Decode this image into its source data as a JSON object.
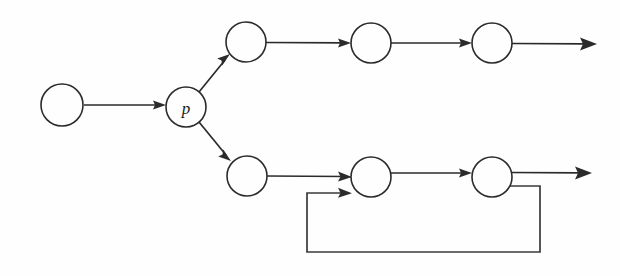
{
  "diagram": {
    "type": "directed-graph",
    "background_color": "#fefefe",
    "stroke_color": "#2b2b2b",
    "canvas": {
      "width": 620,
      "height": 276
    },
    "nodes": [
      {
        "id": "n0",
        "label": "",
        "cx": 62,
        "cy": 105,
        "r": 21,
        "name": "node-start"
      },
      {
        "id": "p",
        "label": "p",
        "cx": 186,
        "cy": 107,
        "r": 20,
        "name": "node-p"
      },
      {
        "id": "u1",
        "label": "",
        "cx": 246,
        "cy": 42,
        "r": 20,
        "name": "node-upper-1"
      },
      {
        "id": "u2",
        "label": "",
        "cx": 371,
        "cy": 43,
        "r": 20,
        "name": "node-upper-2"
      },
      {
        "id": "u3",
        "label": "",
        "cx": 492,
        "cy": 43,
        "r": 20,
        "name": "node-upper-3"
      },
      {
        "id": "l1",
        "label": "",
        "cx": 247,
        "cy": 176,
        "r": 20,
        "name": "node-lower-1"
      },
      {
        "id": "l2",
        "label": "",
        "cx": 371,
        "cy": 177,
        "r": 20,
        "name": "node-lower-2"
      },
      {
        "id": "l3",
        "label": "",
        "cx": 492,
        "cy": 177,
        "r": 20,
        "name": "node-lower-3"
      }
    ],
    "edges": [
      {
        "id": "e0",
        "from": "n0",
        "to": "p",
        "kind": "straight",
        "name": "edge-start-to-p"
      },
      {
        "id": "e1",
        "from": "p",
        "to": "u1",
        "kind": "diagonal-up",
        "name": "edge-p-to-upper-1"
      },
      {
        "id": "e2",
        "from": "p",
        "to": "l1",
        "kind": "diagonal-down",
        "name": "edge-p-to-lower-1"
      },
      {
        "id": "e3",
        "from": "u1",
        "to": "u2",
        "kind": "straight",
        "name": "edge-upper-1-to-2"
      },
      {
        "id": "e4",
        "from": "u2",
        "to": "u3",
        "kind": "straight",
        "name": "edge-upper-2-to-3"
      },
      {
        "id": "e5",
        "from": "u3",
        "to": "",
        "kind": "open-end",
        "name": "edge-upper-3-to-exit"
      },
      {
        "id": "e6",
        "from": "l1",
        "to": "l2",
        "kind": "straight",
        "name": "edge-lower-1-to-2"
      },
      {
        "id": "e7",
        "from": "l2",
        "to": "l3",
        "kind": "straight",
        "name": "edge-lower-2-to-3"
      },
      {
        "id": "e8",
        "from": "l3",
        "to": "",
        "kind": "open-end",
        "name": "edge-lower-3-to-exit"
      },
      {
        "id": "e9",
        "from": "l3",
        "to": "l2",
        "kind": "feedback-loop",
        "name": "edge-feedback-loop"
      }
    ],
    "feedback_loop": {
      "right_x": 540,
      "bottom_y": 252,
      "left_x": 307,
      "entry_y": 193,
      "exit_y": 186,
      "name": "feedback-loop-path"
    },
    "exits": [
      {
        "id": "x1",
        "x": 597,
        "y": 44,
        "name": "upper-exit-arrow"
      },
      {
        "id": "x2",
        "x": 592,
        "y": 173,
        "name": "lower-exit-arrow"
      }
    ]
  }
}
